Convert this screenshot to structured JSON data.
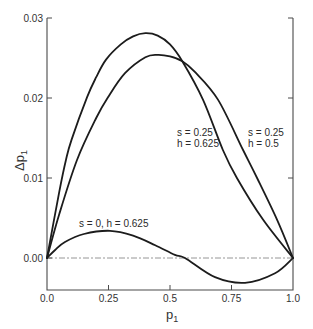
{
  "chart_data": {
    "type": "line",
    "title": "",
    "xlabel": "p1",
    "ylabel": "Δp1",
    "xlim": [
      0.0,
      1.0
    ],
    "ylim": [
      -0.004,
      0.03
    ],
    "grid": false,
    "legend": "none (inline annotations)",
    "x_ticks": [
      "0.0",
      "0.25",
      "0.5",
      "0.75",
      "1.0"
    ],
    "y_ticks": [
      "0.00",
      "0.01",
      "0.02",
      "0.03"
    ],
    "reference_line": {
      "y": 0.0,
      "style": "dash-dot",
      "color": "#8a8a8a"
    },
    "series": [
      {
        "name": "s = 0.25, h = 0.625",
        "x": [
          0,
          0.05,
          0.077,
          0.1,
          0.163,
          0.2,
          0.24,
          0.3,
          0.35,
          0.4,
          0.45,
          0.5,
          0.55,
          0.634,
          0.715,
          0.772,
          0.878,
          1.0
        ],
        "values": [
          0,
          0.0083,
          0.01225,
          0.0148,
          0.0201,
          0.0226,
          0.0248,
          0.0267,
          0.0277,
          0.0281,
          0.0278,
          0.0267,
          0.0246,
          0.0198,
          0.0135,
          0.01,
          0.0048,
          0
        ]
      },
      {
        "name": "s = 0.25, h = 0.5",
        "x": [
          0,
          0.05,
          0.122,
          0.2,
          0.248,
          0.317,
          0.4,
          0.45,
          0.5,
          0.55,
          0.6,
          0.695,
          0.797,
          0.854,
          0.935,
          1.0
        ],
        "values": [
          0,
          0.0055,
          0.01225,
          0.0175,
          0.0201,
          0.0231,
          0.0251,
          0.0254,
          0.0252,
          0.0246,
          0.0233,
          0.0198,
          0.0135,
          0.01,
          0.0048,
          0
        ]
      },
      {
        "name": "s = 0, h = 0.625",
        "x": [
          0,
          0.033,
          0.073,
          0.15,
          0.256,
          0.35,
          0.44,
          0.52,
          0.561,
          0.683,
          0.805,
          0.927,
          1.0
        ],
        "values": [
          0,
          0.001,
          0.002,
          0.003,
          0.0034,
          0.0028,
          0.0016,
          0.0004,
          0.0,
          -0.0024,
          -0.0031,
          -0.0019,
          0
        ]
      }
    ],
    "annotations": [
      {
        "line1": "s = 0.25",
        "line2": "h = 0.625"
      },
      {
        "line1": "s = 0.25",
        "line2": "h = 0.5"
      },
      {
        "line1": "s = 0, h = 0.625"
      }
    ],
    "color": "#1c1c1c"
  }
}
